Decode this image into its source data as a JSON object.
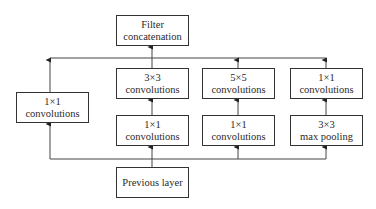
{
  "diagram": {
    "type": "inception-module",
    "nodes": {
      "filter_concat": {
        "line1": "Filter",
        "line2": "concatenation"
      },
      "left_1x1": {
        "line1": "1×1",
        "line2": "convolutions"
      },
      "conv3x3": {
        "line1": "3×3",
        "line2": "convolutions"
      },
      "conv5x5": {
        "line1": "5×5",
        "line2": "convolutions"
      },
      "proj_1x1": {
        "line1": "1×1",
        "line2": "convolutions"
      },
      "reduce_1x1_a": {
        "line1": "1×1",
        "line2": "convolutions"
      },
      "reduce_1x1_b": {
        "line1": "1×1",
        "line2": "convolutions"
      },
      "maxpool3x3": {
        "line1": "3×3",
        "line2": "max pooling"
      },
      "previous_layer": {
        "line1": "Previous layer"
      }
    },
    "edges": [
      [
        "previous_layer",
        "left_1x1"
      ],
      [
        "previous_layer",
        "reduce_1x1_a"
      ],
      [
        "previous_layer",
        "reduce_1x1_b"
      ],
      [
        "previous_layer",
        "maxpool3x3"
      ],
      [
        "reduce_1x1_a",
        "conv3x3"
      ],
      [
        "reduce_1x1_b",
        "conv5x5"
      ],
      [
        "maxpool3x3",
        "proj_1x1"
      ],
      [
        "left_1x1",
        "filter_concat"
      ],
      [
        "conv3x3",
        "filter_concat"
      ],
      [
        "conv5x5",
        "filter_concat"
      ],
      [
        "proj_1x1",
        "filter_concat"
      ]
    ],
    "colors": {
      "stroke": "#333333",
      "background": "#ffffff"
    }
  }
}
